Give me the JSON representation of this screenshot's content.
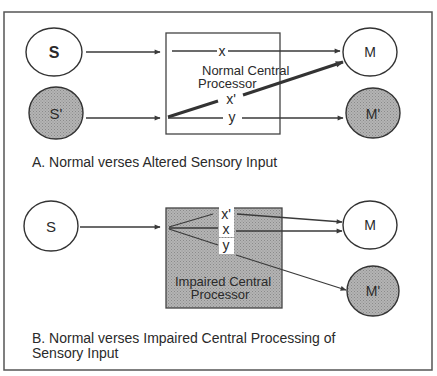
{
  "panel_a": {
    "caption": "A. Normal verses Altered Sensory Input",
    "processor_label_line1": "Normal Central",
    "processor_label_line2": "Processor",
    "nodes": {
      "s": "S",
      "s_prime": "S'",
      "m": "M",
      "m_prime": "M'"
    },
    "paths": {
      "x": "x",
      "x_prime": "x'",
      "y": "y"
    }
  },
  "panel_b": {
    "caption_line1": "B. Normal verses Impaired Central Processing of",
    "caption_line2": "Sensory Input",
    "processor_label_line1": "Impaired Central",
    "processor_label_line2": "Processor",
    "nodes": {
      "s": "S",
      "m": "M",
      "m_prime": "M'"
    },
    "paths": {
      "x_prime": "x'",
      "x": "x",
      "y": "y"
    }
  },
  "colors": {
    "line": "#3a3a3a",
    "shaded_fill": "#a8a8a8",
    "background": "#ffffff"
  }
}
